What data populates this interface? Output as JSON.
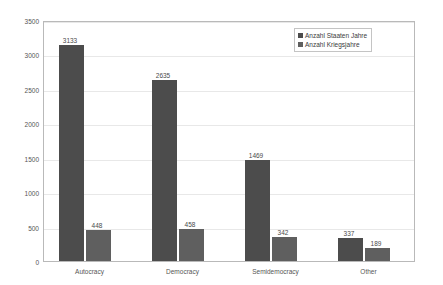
{
  "top_artifact_text": "··· ▪ ··· ▫ ···· ▫ ······· ▫ ·· ▫ ·",
  "legend": {
    "position": "top-right",
    "items": [
      {
        "label": "Anzahl Staaten Jahre",
        "color": "#4c4c4c"
      },
      {
        "label": "Anzahl Kriegsjahre",
        "color": "#5f5f5f"
      }
    ]
  },
  "chart_data": {
    "type": "bar",
    "title": "",
    "xlabel": "",
    "ylabel": "",
    "categories": [
      "Autocracy",
      "Democracy",
      "Semidemocracy",
      "Other"
    ],
    "series": [
      {
        "name": "Anzahl Staaten Jahre",
        "color": "#4c4c4c",
        "values": [
          3133,
          2635,
          1469,
          337
        ]
      },
      {
        "name": "Anzahl Kriegsjahre",
        "color": "#5f5f5f",
        "values": [
          448,
          458,
          342,
          189
        ]
      }
    ],
    "ylim": [
      0,
      3500
    ],
    "yticks": [
      0,
      500,
      1000,
      1500,
      2000,
      2500,
      3000,
      3500
    ],
    "ytick_labels": [
      "0",
      "500",
      "1000",
      "1500",
      "2000",
      "2500",
      "3000",
      "3500"
    ],
    "grid": true,
    "data_labels": true,
    "plot_background": "#ffffff",
    "grid_color": "#e8e8e8",
    "border_color": "#b9b9b9"
  }
}
